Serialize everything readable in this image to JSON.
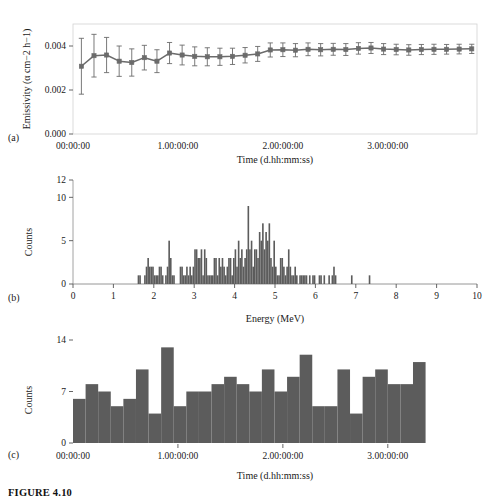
{
  "caption": "FIGURE 4.10",
  "panels": {
    "a": {
      "label": "(a)"
    },
    "b": {
      "label": "(b)"
    },
    "c": {
      "label": "(c)"
    }
  },
  "chart_data": [
    {
      "type": "line",
      "panel": "(a)",
      "title": "",
      "xlabel": "Time (d.hh:mm:ss)",
      "ylabel": "Emissivity (α cm−2 h−1)",
      "ylim": [
        0.0,
        0.005
      ],
      "xlim": [
        0,
        3.85
      ],
      "yticks": [
        0.0,
        0.002,
        0.004
      ],
      "ytick_labels": [
        "0.000",
        "0.002",
        "0.004"
      ],
      "xticks": [
        0,
        1,
        2,
        3
      ],
      "xtick_labels": [
        "00:00:00",
        "1.00:00:00",
        "2.00:00:00",
        "3.00:00:00"
      ],
      "grid": false,
      "marker": "square",
      "error_bars": true,
      "color": "#6b6b6b",
      "x": [
        0.08,
        0.2,
        0.32,
        0.44,
        0.56,
        0.68,
        0.8,
        0.92,
        1.04,
        1.16,
        1.28,
        1.4,
        1.52,
        1.64,
        1.76,
        1.88,
        2.0,
        2.12,
        2.24,
        2.36,
        2.48,
        2.6,
        2.72,
        2.84,
        2.96,
        3.08,
        3.2,
        3.32,
        3.44,
        3.56,
        3.68,
        3.8
      ],
      "y": [
        0.00308,
        0.00356,
        0.00359,
        0.00331,
        0.00325,
        0.00347,
        0.00331,
        0.00368,
        0.00359,
        0.00353,
        0.00351,
        0.00351,
        0.00353,
        0.00358,
        0.00364,
        0.00382,
        0.00383,
        0.00381,
        0.00385,
        0.00383,
        0.00385,
        0.00384,
        0.00389,
        0.00391,
        0.00386,
        0.00384,
        0.00382,
        0.00384,
        0.00385,
        0.00385,
        0.00386,
        0.00387
      ],
      "yerr": [
        0.00127,
        0.00097,
        0.0008,
        0.00069,
        0.00062,
        0.00056,
        0.00052,
        0.00048,
        0.00045,
        0.00043,
        0.00041,
        0.00039,
        0.00037,
        0.00035,
        0.00034,
        0.00032,
        0.00031,
        0.0003,
        0.00029,
        0.00028,
        0.00027,
        0.00027,
        0.00026,
        0.00025,
        0.00025,
        0.00024,
        0.00024,
        0.00023,
        0.00023,
        0.00022,
        0.00022,
        0.00021
      ]
    },
    {
      "type": "bar",
      "panel": "(b)",
      "title": "",
      "xlabel": "Energy (MeV)",
      "ylabel": "Counts",
      "ylim": [
        0,
        12
      ],
      "xlim": [
        0,
        10
      ],
      "yticks": [
        0,
        5,
        10,
        12
      ],
      "ytick_labels": [
        "0",
        "5",
        "10",
        "12"
      ],
      "xticks": [
        0,
        1,
        2,
        3,
        4,
        5,
        6,
        7,
        8,
        9,
        10
      ],
      "xtick_labels": [
        "0",
        "1",
        "2",
        "3",
        "4",
        "5",
        "6",
        "7",
        "8",
        "9",
        "10"
      ],
      "grid": false,
      "color": "#5c5c5c",
      "bin_width": 0.04,
      "bin_start": 1.6,
      "values": [
        1,
        1,
        0,
        0,
        1,
        2,
        3,
        2,
        2,
        2,
        1,
        1,
        1,
        2,
        2,
        1,
        0,
        1,
        2,
        5,
        3,
        1,
        1,
        0,
        0,
        0,
        2,
        2,
        1,
        1,
        2,
        1,
        2,
        1,
        2,
        4,
        4,
        3,
        3,
        4,
        1,
        4,
        3,
        1,
        1,
        1,
        1,
        3,
        3,
        1,
        3,
        2,
        3,
        2,
        1,
        2,
        3,
        3,
        1,
        3,
        4,
        2,
        5,
        3,
        4,
        2,
        3,
        4,
        9,
        4,
        5,
        2,
        4,
        4,
        3,
        6,
        5,
        7,
        4,
        6,
        5,
        7,
        3,
        2,
        5,
        2,
        1,
        1,
        3,
        3,
        2,
        1,
        2,
        4,
        2,
        1,
        1,
        2,
        1,
        0,
        1,
        1,
        1,
        1,
        1,
        0,
        1,
        0,
        1,
        1,
        0,
        0,
        1,
        1,
        0,
        1,
        0,
        0,
        1,
        0,
        1,
        2,
        1,
        0,
        0,
        0,
        0,
        0,
        0,
        0,
        0,
        0,
        1,
        0,
        0,
        0,
        0,
        0,
        0,
        0,
        0,
        0,
        0,
        1,
        0,
        0,
        0,
        0,
        0,
        0,
        0,
        0,
        0,
        0,
        0,
        0,
        0,
        0,
        0,
        0,
        0,
        0,
        0,
        0,
        0,
        0,
        0,
        0,
        0,
        0,
        0,
        0,
        0,
        0,
        0,
        0,
        0,
        0,
        0
      ]
    },
    {
      "type": "bar",
      "panel": "(c)",
      "title": "",
      "xlabel": "Time (d.hh:mm:ss)",
      "ylabel": "Counts",
      "ylim": [
        0,
        14
      ],
      "xlim": [
        0,
        3.85
      ],
      "yticks": [
        0,
        7,
        14
      ],
      "ytick_labels": [
        "0",
        "7",
        "14"
      ],
      "xticks": [
        0,
        1,
        2,
        3
      ],
      "xtick_labels": [
        "00:00:00",
        "1.00:00:00",
        "2.00:00:00",
        "3.00:00:00"
      ],
      "grid": false,
      "color": "#5c5c5c",
      "bin_width": 0.12,
      "values": [
        6,
        8,
        7,
        5,
        6,
        10,
        4,
        13,
        5,
        7,
        7,
        8,
        9,
        8,
        7,
        10,
        7,
        9,
        12,
        5,
        5,
        10,
        4,
        9,
        10,
        8,
        8,
        11
      ]
    }
  ]
}
